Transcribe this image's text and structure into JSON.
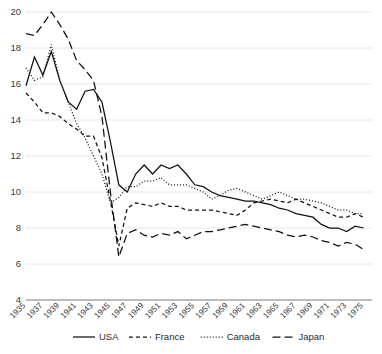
{
  "chart_data": {
    "type": "line",
    "title": "",
    "xlabel": "",
    "ylabel": "",
    "ylim": [
      4,
      20
    ],
    "xlim": [
      1935,
      1976
    ],
    "grid": true,
    "legend_position": "bottom",
    "ytick_labels": [
      "20",
      "18",
      "16",
      "14",
      "12",
      "10",
      "8",
      "6",
      "4"
    ],
    "ytick_values": [
      20,
      18,
      16,
      14,
      12,
      10,
      8,
      6,
      4
    ],
    "xtick_labels": [
      "1935",
      "1937",
      "1939",
      "1941",
      "1943",
      "1945",
      "1947",
      "1949",
      "1951",
      "1953",
      "1955",
      "1957",
      "1959",
      "1961",
      "1963",
      "1965",
      "1967",
      "1969",
      "1971",
      "1973",
      "1975"
    ],
    "xtick_values": [
      1935,
      1937,
      1939,
      1941,
      1943,
      1945,
      1947,
      1949,
      1951,
      1953,
      1955,
      1957,
      1959,
      1961,
      1963,
      1965,
      1967,
      1969,
      1971,
      1973,
      1975
    ],
    "x": [
      1935,
      1936,
      1937,
      1938,
      1939,
      1940,
      1941,
      1942,
      1943,
      1944,
      1945,
      1946,
      1947,
      1948,
      1949,
      1950,
      1951,
      1952,
      1953,
      1954,
      1955,
      1956,
      1957,
      1958,
      1959,
      1960,
      1961,
      1962,
      1963,
      1964,
      1965,
      1966,
      1967,
      1968,
      1969,
      1970,
      1971,
      1972,
      1973,
      1974,
      1975
    ],
    "series": [
      {
        "name": "USA",
        "style": "solid",
        "dash": "none",
        "values": [
          15.9,
          17.5,
          16.5,
          17.8,
          16.2,
          15.0,
          14.6,
          15.6,
          15.7,
          15.0,
          12.8,
          10.4,
          10.0,
          11.0,
          11.5,
          11.0,
          11.5,
          11.3,
          11.5,
          11.0,
          10.4,
          10.3,
          10.0,
          9.8,
          9.7,
          9.6,
          9.5,
          9.5,
          9.4,
          9.3,
          9.1,
          9.0,
          8.8,
          8.7,
          8.6,
          8.2,
          8.0,
          8.0,
          7.8,
          8.1,
          8.0
        ]
      },
      {
        "name": "France",
        "style": "dashed",
        "dash": "4 3",
        "values": [
          15.5,
          15.0,
          14.4,
          14.4,
          14.2,
          13.8,
          13.5,
          13.1,
          13.1,
          11.9,
          9.5,
          7.0,
          9.1,
          9.4,
          9.3,
          9.2,
          9.4,
          9.2,
          9.2,
          9.0,
          9.0,
          9.0,
          9.0,
          8.9,
          8.8,
          8.7,
          9.0,
          9.4,
          9.5,
          9.6,
          9.5,
          9.4,
          9.6,
          9.4,
          9.2,
          9.0,
          8.8,
          8.6,
          8.6,
          8.8,
          8.6
        ]
      },
      {
        "name": "Canada",
        "style": "dotted",
        "dash": "1 2",
        "values": [
          16.9,
          16.2,
          16.4,
          18.2,
          16.2,
          15.0,
          13.8,
          13.0,
          12.0,
          11.0,
          9.4,
          9.7,
          10.3,
          10.3,
          10.6,
          10.6,
          10.8,
          10.4,
          10.4,
          10.4,
          10.2,
          10.0,
          9.6,
          9.8,
          10.1,
          10.2,
          10.0,
          9.8,
          9.6,
          9.8,
          10.0,
          9.8,
          9.6,
          9.6,
          9.5,
          9.4,
          9.2,
          9.0,
          9.0,
          8.8,
          8.8
        ]
      },
      {
        "name": "Japan",
        "style": "longdash",
        "dash": "8 4",
        "values": [
          18.8,
          18.7,
          19.3,
          20.0,
          19.3,
          18.5,
          17.3,
          16.8,
          16.2,
          14.2,
          10.0,
          6.4,
          7.7,
          7.9,
          7.6,
          7.5,
          7.7,
          7.6,
          7.8,
          7.4,
          7.6,
          7.8,
          7.8,
          7.9,
          8.0,
          8.1,
          8.2,
          8.1,
          8.0,
          7.9,
          7.8,
          7.6,
          7.5,
          7.6,
          7.5,
          7.3,
          7.2,
          7.0,
          7.2,
          7.1,
          6.8
        ]
      }
    ]
  },
  "legend": {
    "items": [
      {
        "label": "USA",
        "style": "solid"
      },
      {
        "label": "France",
        "style": "dashed"
      },
      {
        "label": "Canada",
        "style": "dotted"
      },
      {
        "label": "Japan",
        "style": "longdash"
      }
    ]
  },
  "colors": {
    "line": "#111111",
    "grid": "#e2e2e2",
    "axis": "#7a7a7a",
    "text": "#3a3a3a"
  }
}
